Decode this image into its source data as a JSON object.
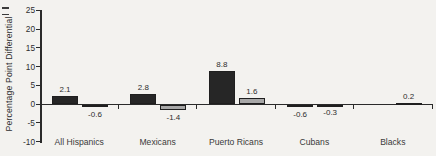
{
  "chart_data": {
    "type": "bar",
    "title": "",
    "ylabel": "Percentage Point Differential",
    "xlabel": "",
    "categories": [
      "All Hispanics",
      "Mexicans",
      "Puerto Ricans",
      "Cubans",
      "Blacks"
    ],
    "series": [
      {
        "name": "series-dark",
        "color": "#262626",
        "values": [
          2.1,
          2.8,
          8.8,
          -0.6,
          null
        ]
      },
      {
        "name": "series-gray",
        "color": "#a8a8a8",
        "values": [
          -0.6,
          -1.4,
          1.6,
          -0.3,
          0.2
        ]
      }
    ],
    "value_labels": [
      "2.1",
      "-0.6",
      "2.8",
      "-1.4",
      "8.8",
      "1.6",
      "-0.6",
      "-0.3",
      "0.2"
    ],
    "y_ticks": [
      25,
      20,
      15,
      10,
      5,
      0,
      -5,
      -10
    ],
    "ylim": [
      -10,
      25
    ],
    "grid": false,
    "legend": "none",
    "bars_have_outline": true
  },
  "colors": {
    "background": "#f3f2ef",
    "axis": "#2a2a2a",
    "text": "#2e2e2e"
  }
}
